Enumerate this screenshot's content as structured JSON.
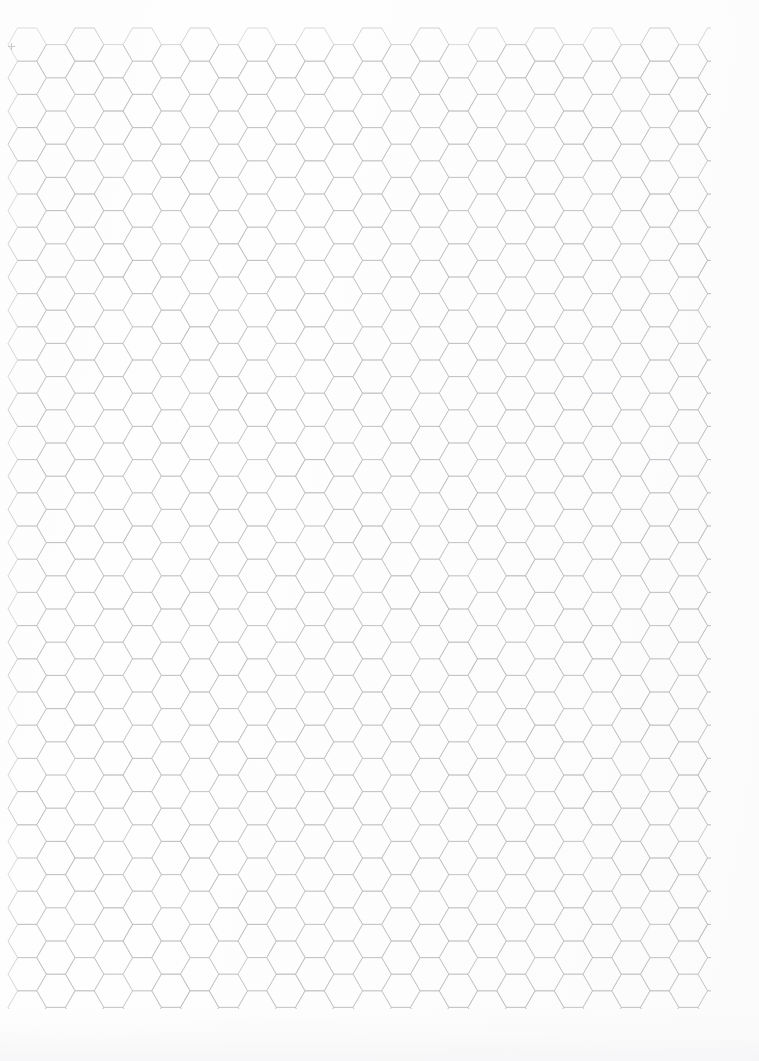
{
  "page": {
    "title": "Hexagonal Graph Paper",
    "width": 759,
    "height": 1061,
    "background_color": "#fdfdfd",
    "paper_tint": "#fefefe"
  },
  "grid": {
    "name": "hex-grid",
    "orientation": "flat-top",
    "line_color": "#b9b9bd",
    "line_width": 0.7,
    "hex_width": 38.3,
    "hex_height": 33.2,
    "column_pitch": 28.75,
    "row_pitch": 33.2,
    "origin_x": 8,
    "origin_y": 28,
    "area_left": 8,
    "area_top": 28,
    "area_right": 710,
    "area_bottom": 1008,
    "columns": 25,
    "rows": 31,
    "total_cells": 775
  },
  "marks": {
    "crop_mark": {
      "label": "+",
      "x": 8,
      "y": 43,
      "color": "#c9c9cd"
    }
  },
  "chart_data": {
    "type": "table",
    "title": "Hexagonal Graph Paper",
    "xlabel": "",
    "ylabel": "",
    "categories": [
      "hex-grid"
    ],
    "values": [
      775
    ]
  }
}
